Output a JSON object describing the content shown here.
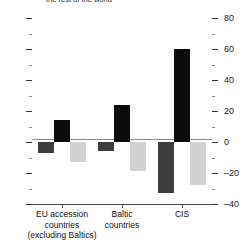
{
  "chart_data": {
    "type": "bar",
    "title": "the rest of the world",
    "xlabel": "",
    "ylabel": "",
    "ylim": [
      -40,
      80
    ],
    "yticks": [
      -40,
      -20,
      0,
      20,
      40,
      60,
      80
    ],
    "ytick_labels": [
      "–40",
      "–20",
      "0",
      "20",
      "40",
      "60",
      "80"
    ],
    "minor_ticks": true,
    "grid": false,
    "legend": null,
    "y_axis_position": "right",
    "categories": [
      "EU accession countries (excluding Baltics)",
      "Baltic countries",
      "CIS"
    ],
    "category_lines": [
      [
        "EU accession",
        "countries",
        "(excluding Baltics)"
      ],
      [
        "Baltic",
        "countries"
      ],
      [
        "CIS"
      ]
    ],
    "series": [
      {
        "name": "series-1",
        "color": "#3d3d3d",
        "values": [
          -7,
          -6,
          -33
        ]
      },
      {
        "name": "series-2",
        "color": "#0b0b0b",
        "values": [
          14,
          24,
          60
        ]
      },
      {
        "name": "series-3",
        "color": "#d2d2d2",
        "values": [
          -13,
          -19,
          -28
        ]
      }
    ]
  },
  "colors": {
    "series_1": "#3d3d3d",
    "series_2": "#0b0b0b",
    "series_3": "#d2d2d2",
    "axis": "#4a4a4a",
    "zero_line": "#8c8c8c",
    "background": "#ffffff",
    "text": "#111111"
  }
}
